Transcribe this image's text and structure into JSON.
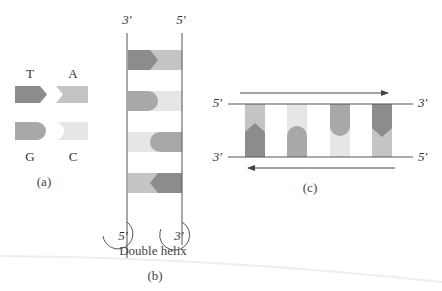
{
  "colors": {
    "T": "#8c8c8c",
    "A": "#c4c4c4",
    "G": "#a8a8a8",
    "C": "#e6e6e6",
    "line": "#555555"
  },
  "panel_a": {
    "caption": "(a)",
    "bases": {
      "T": "T",
      "A": "A",
      "G": "G",
      "C": "C"
    }
  },
  "panel_b": {
    "caption": "(b)",
    "subtitle": "Double helix",
    "top_left": "3′",
    "top_right": "5′",
    "bottom_left": "5′",
    "bottom_right": "3′",
    "pairs": [
      "T-A",
      "G-C",
      "C-G",
      "A-T"
    ]
  },
  "panel_c": {
    "caption": "(c)",
    "top_left": "5′",
    "top_right": "3′",
    "bottom_left": "3′",
    "bottom_right": "5′",
    "pairs": [
      "A-T",
      "C-G",
      "G-C",
      "T-A"
    ]
  }
}
